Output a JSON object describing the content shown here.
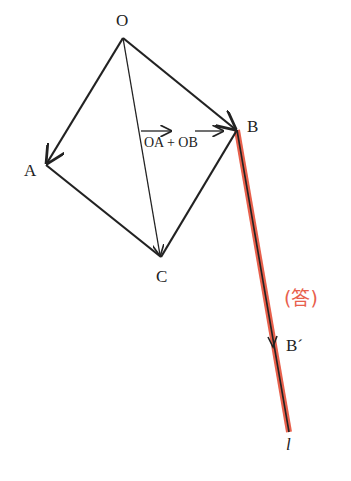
{
  "diagram": {
    "points": {
      "O": {
        "label": "O",
        "x": 123,
        "y": 38
      },
      "A": {
        "label": "A",
        "x": 46,
        "y": 165
      },
      "B": {
        "label": "B",
        "x": 237,
        "y": 130
      },
      "C": {
        "label": "C",
        "x": 161,
        "y": 257
      },
      "B_prime": {
        "label": "B´",
        "x": 273,
        "y": 345
      },
      "l_end": {
        "label": "l",
        "x": 289,
        "y": 432
      }
    },
    "vector_label": {
      "part1": "OA",
      "plus": "+",
      "part2": "OB"
    },
    "answer_label": "(答)",
    "line_label": "l",
    "colors": {
      "ink": "#222222",
      "highlight": "#e8604c",
      "answer": "#e8604c"
    }
  }
}
